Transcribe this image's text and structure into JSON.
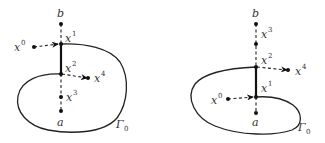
{
  "figures": [
    {
      "id": "left",
      "labels": {
        "b": "b",
        "a": "a",
        "x0": "x",
        "x0_sup": "0",
        "x1": "x",
        "x1_sup": "1",
        "x2": "x",
        "x2_sup": "2",
        "x3": "x",
        "x3_sup": "3",
        "x4": "x",
        "x4_sup": "4",
        "gamma": "Γ",
        "gamma_sub": "0"
      },
      "description": "Vertical segment a–b crossing curve Γ0; x1 (top) and x2 (lower) on curve, solid segment between them; x3 between x2 and a; x0 arrow into x1, x4 arrow out from x2"
    },
    {
      "id": "right",
      "labels": {
        "b": "b",
        "a": "a",
        "x0": "x",
        "x0_sup": "0",
        "x1": "x",
        "x1_sup": "1",
        "x2": "x",
        "x2_sup": "2",
        "x3": "x",
        "x3_sup": "3",
        "x4": "x",
        "x4_sup": "4",
        "gamma": "Γ",
        "gamma_sub": "0"
      },
      "description": "Vertical segment a–b crossing curve Γ0; x2 (top) and x1 (lower) on curve, solid segment between them; x3 between b and x2; x0 arrow into x1, x4 arrow out from x2"
    }
  ],
  "colors": {
    "ink": "#222222",
    "background": "#ffffff"
  }
}
